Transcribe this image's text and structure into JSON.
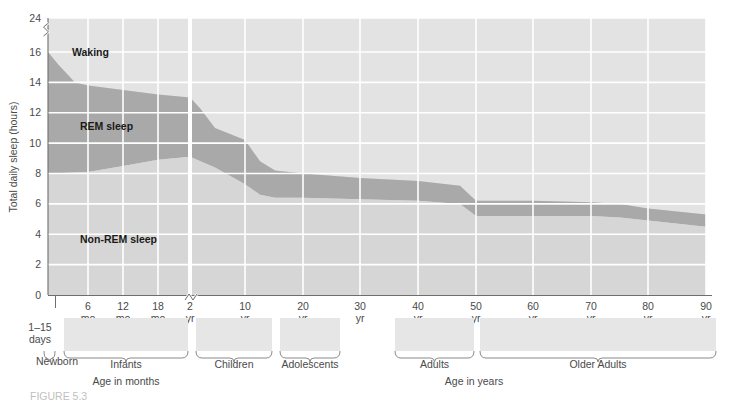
{
  "chart_data": {
    "type": "area",
    "ylabel": "Total daily sleep (hours)",
    "xlabel_left": "Age in months",
    "xlabel_right": "Age in years",
    "ylim": [
      0,
      24
    ],
    "y_ticks": [
      0,
      2,
      4,
      6,
      8,
      10,
      12,
      14,
      16,
      24
    ],
    "y_axis_break_between": [
      16,
      24
    ],
    "grid": true,
    "legend_position": "in-plot",
    "x_axis_break_after": "2 yr",
    "x_ticks": [
      {
        "label": "6",
        "unit": "mo",
        "px": 88
      },
      {
        "label": "12",
        "unit": "mo",
        "px": 123
      },
      {
        "label": "18",
        "unit": "mo",
        "px": 158
      },
      {
        "label": "2",
        "unit": "yr",
        "px": 190
      },
      {
        "label": "10",
        "unit": "yr",
        "px": 245
      },
      {
        "label": "20",
        "unit": "yr",
        "px": 303
      },
      {
        "label": "30",
        "unit": "yr",
        "px": 360
      },
      {
        "label": "40",
        "unit": "yr",
        "px": 418
      },
      {
        "label": "50",
        "unit": "yr",
        "px": 476
      },
      {
        "label": "60",
        "unit": "yr",
        "px": 533
      },
      {
        "label": "70",
        "unit": "yr",
        "px": 591
      },
      {
        "label": "80",
        "unit": "yr",
        "px": 648
      },
      {
        "label": "90",
        "unit": "yr",
        "px": 706
      }
    ],
    "series": [
      {
        "name": "Total sleep (top of sleep area)",
        "points": [
          {
            "x_px": 48,
            "hours": 16.0
          },
          {
            "x_px": 58,
            "hours": 15.2
          },
          {
            "x_px": 75,
            "hours": 14.0
          },
          {
            "x_px": 88,
            "hours": 13.8
          },
          {
            "x_px": 123,
            "hours": 13.5
          },
          {
            "x_px": 158,
            "hours": 13.2
          },
          {
            "x_px": 190,
            "hours": 13.0
          },
          {
            "x_px": 200,
            "hours": 12.3
          },
          {
            "x_px": 215,
            "hours": 11.0
          },
          {
            "x_px": 245,
            "hours": 10.2
          },
          {
            "x_px": 260,
            "hours": 8.8
          },
          {
            "x_px": 275,
            "hours": 8.2
          },
          {
            "x_px": 303,
            "hours": 8.0
          },
          {
            "x_px": 360,
            "hours": 7.7
          },
          {
            "x_px": 418,
            "hours": 7.5
          },
          {
            "x_px": 460,
            "hours": 7.2
          },
          {
            "x_px": 476,
            "hours": 6.2
          },
          {
            "x_px": 533,
            "hours": 6.2
          },
          {
            "x_px": 591,
            "hours": 6.1
          },
          {
            "x_px": 620,
            "hours": 6.0
          },
          {
            "x_px": 648,
            "hours": 5.7
          },
          {
            "x_px": 706,
            "hours": 5.3
          }
        ]
      },
      {
        "name": "Non-REM / REM boundary",
        "points": [
          {
            "x_px": 48,
            "hours": 8.0
          },
          {
            "x_px": 88,
            "hours": 8.1
          },
          {
            "x_px": 123,
            "hours": 8.5
          },
          {
            "x_px": 158,
            "hours": 8.9
          },
          {
            "x_px": 190,
            "hours": 9.1
          },
          {
            "x_px": 215,
            "hours": 8.4
          },
          {
            "x_px": 245,
            "hours": 7.3
          },
          {
            "x_px": 260,
            "hours": 6.6
          },
          {
            "x_px": 275,
            "hours": 6.4
          },
          {
            "x_px": 303,
            "hours": 6.4
          },
          {
            "x_px": 360,
            "hours": 6.3
          },
          {
            "x_px": 418,
            "hours": 6.2
          },
          {
            "x_px": 460,
            "hours": 6.0
          },
          {
            "x_px": 476,
            "hours": 5.2
          },
          {
            "x_px": 533,
            "hours": 5.2
          },
          {
            "x_px": 591,
            "hours": 5.2
          },
          {
            "x_px": 620,
            "hours": 5.1
          },
          {
            "x_px": 648,
            "hours": 4.9
          },
          {
            "x_px": 706,
            "hours": 4.5
          }
        ]
      }
    ],
    "bands": [
      {
        "name": "Waking",
        "label": "Waking",
        "color": "#e3e3e3"
      },
      {
        "name": "REM sleep",
        "label": "REM sleep",
        "color": "#a9a9a9"
      },
      {
        "name": "Non-REM sleep",
        "label": "Non-REM sleep",
        "color": "#d6d6d6"
      }
    ],
    "age_groups": [
      {
        "label": "Newborn",
        "sublabel": "1–15\ndays",
        "x_start": 44,
        "x_end": 55
      },
      {
        "label": "Infants",
        "x_start": 64,
        "x_end": 188
      },
      {
        "label": "Children",
        "x_start": 196,
        "x_end": 272
      },
      {
        "label": "Adolescents",
        "x_start": 280,
        "x_end": 340
      },
      {
        "label": "Adults",
        "x_start": 395,
        "x_end": 474
      },
      {
        "label": "Older Adults",
        "x_start": 480,
        "x_end": 716
      }
    ],
    "newborn_range": "1–15",
    "newborn_unit": "days",
    "colors": {
      "plot_background": "#d6d6d6",
      "waking": "#e3e3e3",
      "rem": "#a9a9a9",
      "nonrem": "#d6d6d6",
      "gridline": "#ffffff",
      "axis": "#6e6e6e",
      "text": "#4a4a4a"
    }
  },
  "labels": {
    "y_axis_title": "Total daily sleep (hours)",
    "x_axis_title_left": "Age in months",
    "x_axis_title_right": "Age in years",
    "waking": "Waking",
    "rem_sleep": "REM sleep",
    "non_rem_sleep": "Non-REM sleep",
    "newborn": "Newborn",
    "newborn_days_1": "1–15",
    "newborn_days_2": "days",
    "infants": "Infants",
    "children": "Children",
    "adolescents": "Adolescents",
    "adults": "Adults",
    "older_adults": "Older Adults"
  },
  "caption": {
    "text": "FIGURE 5.3"
  }
}
